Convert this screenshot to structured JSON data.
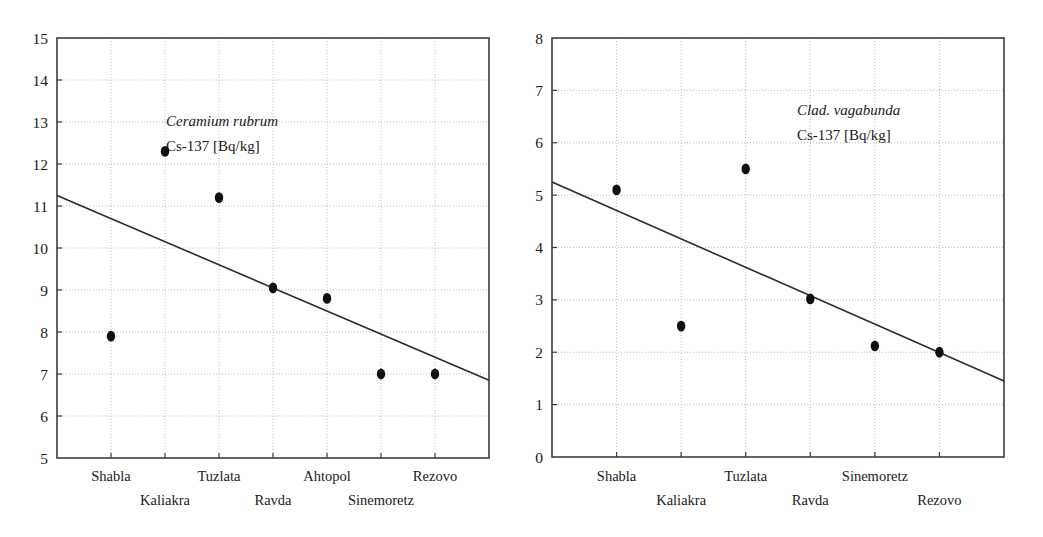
{
  "figure": {
    "background_color": "#ffffff",
    "marker_color": "#101010",
    "line_color": "#2b2b2b",
    "grid_color": "#b4b4b4",
    "frame_color": "#3c3c3c"
  },
  "chart_data": [
    {
      "type": "scatter",
      "id": "ceramium-rubrum",
      "title": "",
      "annotation_species": "Ceramium rubrum",
      "annotation_nuclide": "Cs-137 [Bq/kg]",
      "xlabel": "",
      "ylabel": "",
      "categories": [
        "Shabla",
        "Kaliakra",
        "Tuzlata",
        "Ravda",
        "Ahtopol",
        "Sinemoretz",
        "Rezovo"
      ],
      "values": [
        7.9,
        12.3,
        11.2,
        9.05,
        8.8,
        7.0,
        7.0
      ],
      "ylim": [
        5,
        15
      ],
      "yticks": [
        5,
        6,
        7,
        8,
        9,
        10,
        11,
        12,
        13,
        14,
        15
      ],
      "ytick_labels": [
        "5",
        "6",
        "7",
        "8",
        "9",
        "10",
        "11",
        "12",
        "13",
        "14",
        "15"
      ],
      "grid": true,
      "legend": "none",
      "trendline": {
        "visible": true,
        "y_start": 11.25,
        "y_end": 6.85
      }
    },
    {
      "type": "scatter",
      "id": "clad-vagabunda",
      "title": "",
      "annotation_species": "Clad. vagabunda",
      "annotation_nuclide": "Cs-137 [Bq/kg]",
      "xlabel": "",
      "ylabel": "",
      "categories": [
        "Shabla",
        "Kaliakra",
        "Tuzlata",
        "Ravda",
        "Sinemoretz",
        "Rezovo"
      ],
      "values": [
        5.1,
        2.5,
        5.5,
        3.02,
        2.12,
        2.0
      ],
      "ylim": [
        0,
        8
      ],
      "yticks": [
        0,
        1,
        2,
        3,
        4,
        5,
        6,
        7,
        8
      ],
      "ytick_labels": [
        "0",
        "1",
        "2",
        "3",
        "4",
        "5",
        "6",
        "7",
        "8"
      ],
      "grid": true,
      "legend": "none",
      "trendline": {
        "visible": true,
        "y_start": 5.25,
        "y_end": 1.45
      }
    }
  ]
}
